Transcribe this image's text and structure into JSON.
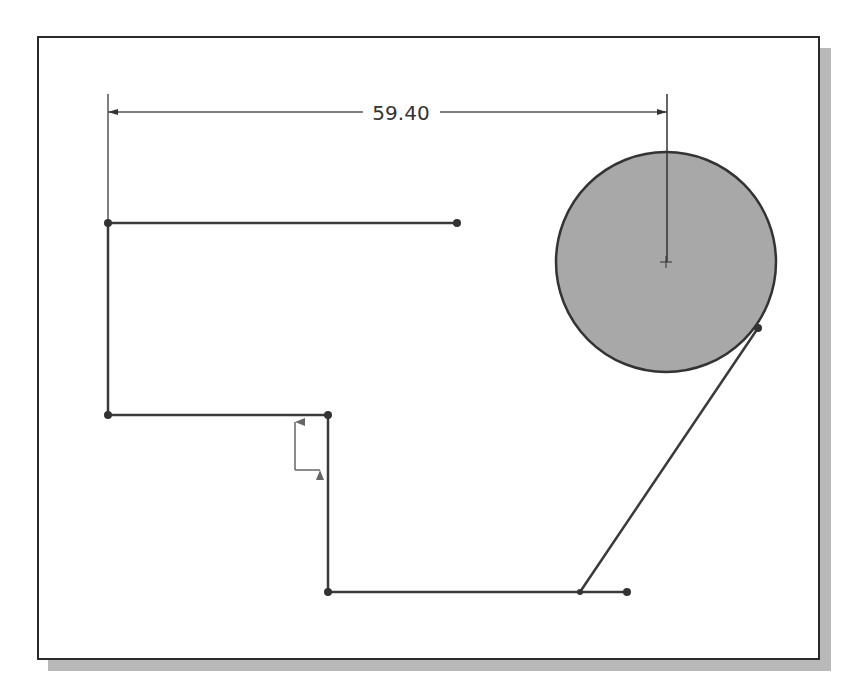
{
  "sketch": {
    "dimension": {
      "label": "59.40",
      "from_x": 108,
      "to_x": 667,
      "y": 112
    },
    "colors": {
      "line": "#3a3a3a",
      "circle_fill": "#a8a8a8",
      "frame": "#2a2a2a",
      "shadow": "#b9b9b9",
      "background": "#ffffff"
    },
    "lines": [
      {
        "id": "top-horizontal",
        "x1": 108,
        "y1": 223,
        "x2": 457,
        "y2": 223
      },
      {
        "id": "left-vertical",
        "x1": 108,
        "y1": 223,
        "x2": 108,
        "y2": 415
      },
      {
        "id": "middle-horizontal",
        "x1": 108,
        "y1": 415,
        "x2": 328,
        "y2": 415
      },
      {
        "id": "step-vertical",
        "x1": 328,
        "y1": 415,
        "x2": 328,
        "y2": 592
      },
      {
        "id": "bottom-horizontal",
        "x1": 328,
        "y1": 592,
        "x2": 627,
        "y2": 592
      },
      {
        "id": "tangent-line",
        "x1": 580,
        "y1": 592,
        "x2": 758,
        "y2": 328
      }
    ],
    "points": [
      {
        "x": 108,
        "y": 223
      },
      {
        "x": 457,
        "y": 223
      },
      {
        "x": 108,
        "y": 415
      },
      {
        "x": 328,
        "y": 415
      },
      {
        "x": 328,
        "y": 592
      },
      {
        "x": 580,
        "y": 592
      },
      {
        "x": 627,
        "y": 592
      },
      {
        "x": 758,
        "y": 328
      }
    ],
    "circle": {
      "cx": 666,
      "cy": 262,
      "r": 110
    },
    "origin": {
      "x": 295,
      "y": 470
    }
  }
}
